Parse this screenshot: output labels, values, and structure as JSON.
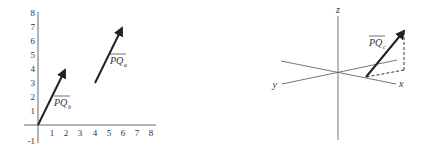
{
  "left_diagram": {
    "type": "2d-vector-plot",
    "x_ticks": [
      "1",
      "2",
      "3",
      "4",
      "5",
      "6",
      "7",
      "8"
    ],
    "y_ticks": [
      "8",
      "7",
      "6",
      "5",
      "4",
      "3",
      "2",
      "1",
      "-1"
    ],
    "vectors": [
      {
        "name": "PQ_b",
        "label": "PQ",
        "subscript": "b",
        "from": [
          0,
          0
        ],
        "to": [
          2,
          4
        ]
      },
      {
        "name": "PQ_a",
        "label": "PQ",
        "subscript": "a",
        "from": [
          4,
          3
        ],
        "to": [
          6,
          7
        ]
      }
    ]
  },
  "right_diagram": {
    "type": "3d-axes",
    "axis_labels": {
      "x": "x",
      "y": "y",
      "z": "z"
    },
    "vector": {
      "name": "PQ_c",
      "label": "PQ",
      "subscript": "c"
    },
    "projection_lines": "dashed"
  },
  "colors": {
    "axis": "#555555",
    "vector": "#222222",
    "text": "#333333"
  }
}
